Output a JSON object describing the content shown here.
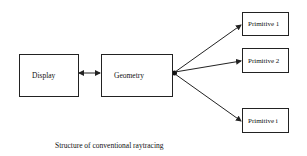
{
  "diagram": {
    "nodes": [
      {
        "id": "display",
        "label": "Display"
      },
      {
        "id": "geometry",
        "label": "Geometry"
      },
      {
        "id": "primitive1",
        "label": "Primitive 1"
      },
      {
        "id": "primitive2",
        "label": "Primitive 2"
      },
      {
        "id": "primitivei",
        "label": "Primitive i"
      }
    ],
    "edges": [
      {
        "from": "display",
        "to": "geometry",
        "type": "bidirectional"
      },
      {
        "from": "geometry",
        "to": "primitive1",
        "type": "directed"
      },
      {
        "from": "geometry",
        "to": "primitive2",
        "type": "directed"
      },
      {
        "from": "geometry",
        "to": "primitivei",
        "type": "directed"
      }
    ],
    "caption": "Structure of conventional raytracing"
  },
  "colors": {
    "stroke": "#222222",
    "background": "#ffffff"
  }
}
